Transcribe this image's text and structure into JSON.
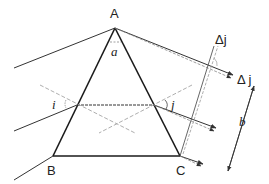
{
  "diagram": {
    "title": "",
    "type": "prism-refraction",
    "labels": {
      "vertex_a": "A",
      "vertex_b": "B",
      "vertex_c": "C",
      "apex_angle": "a",
      "incidence_angle": "i",
      "exit_angle": "j",
      "delta_j_top": "Δj",
      "delta_j_right": "Δ j",
      "beam_width": "b"
    },
    "colors": {
      "prism_edge": "#1a1a1a",
      "ray": "#333333",
      "normal_dashed": "#888888",
      "background": "#ffffff"
    }
  }
}
